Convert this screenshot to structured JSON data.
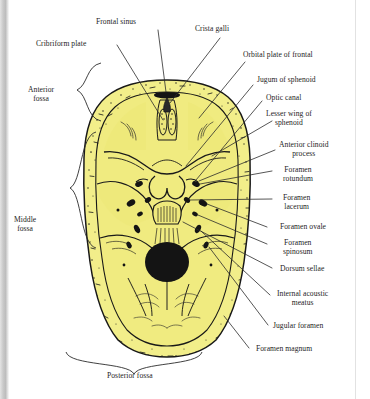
{
  "figure": {
    "view": "superior view of cranial floor",
    "colors": {
      "bone_fill": "#F2EE8A",
      "bone_fill_shadow": "#E6DF72",
      "ink": "#1A1A1A",
      "leader_line": "#2b2b2b",
      "label_text": "#1d1d1d",
      "page_background": "#ffffff",
      "scan_edge_gray": "#c9c9c9",
      "foramen_fill": "#141414"
    }
  },
  "labels": {
    "cribriform_plate": "Cribriform plate",
    "frontal_sinus": "Frontal sinus",
    "crista_galli": "Crista galli",
    "orbital_plate_of_frontal": "Orbital plate of frontal",
    "jugum_of_sphenoid": "Jugum of sphenoid",
    "optic_canal": "Optic canal",
    "lesser_wing_of_sphenoid": "Lesser wing of\nsphenoid",
    "anterior_clinoid_process": "Anterior clinoid\nprocess",
    "foramen_rotundum": "Foramen\nrotundum",
    "foramen_lacerum": "Foramen\nlacerum",
    "foramen_ovale": "Foramen ovale",
    "foramen_spinosum": "Foramen\nspinosum",
    "dorsum_sellae": "Dorsum sellae",
    "internal_acoustic_meatus": "Internal acoustic\nmeatus",
    "jugular_foramen": "Jugular foramen",
    "foramen_magnum": "Foramen magnum",
    "anterior_fossa": "Anterior\nfossa",
    "middle_fossa": "Middle\nfossa",
    "posterior_fossa": "Posterior fossa"
  },
  "fossae": [
    {
      "name": "anterior_fossa",
      "label": "Anterior fossa",
      "side": "left"
    },
    {
      "name": "middle_fossa",
      "label": "Middle fossa",
      "side": "left"
    },
    {
      "name": "posterior_fossa",
      "label": "Posterior fossa",
      "side": "bottom"
    }
  ],
  "structures": [
    {
      "name": "frontal_sinus",
      "label": "Frontal sinus",
      "kind": "air_sinus",
      "side": "midline"
    },
    {
      "name": "crista_galli",
      "label": "Crista galli",
      "kind": "bony_ridge",
      "side": "midline"
    },
    {
      "name": "cribriform_plate",
      "label": "Cribriform plate",
      "kind": "perforated_plate",
      "side": "midline"
    },
    {
      "name": "orbital_plate_of_frontal",
      "label": "Orbital plate of frontal",
      "kind": "bone_plate",
      "side": "right"
    },
    {
      "name": "jugum_of_sphenoid",
      "label": "Jugum of sphenoid",
      "kind": "bone_plate",
      "side": "midline"
    },
    {
      "name": "optic_canal",
      "label": "Optic canal",
      "kind": "canal",
      "side": "right"
    },
    {
      "name": "lesser_wing_of_sphenoid",
      "label": "Lesser wing of sphenoid",
      "kind": "bone_wing",
      "side": "right"
    },
    {
      "name": "anterior_clinoid_process",
      "label": "Anterior clinoid process",
      "kind": "process",
      "side": "right"
    },
    {
      "name": "foramen_rotundum",
      "label": "Foramen rotundum",
      "kind": "foramen",
      "side": "bilateral"
    },
    {
      "name": "foramen_lacerum",
      "label": "Foramen lacerum",
      "kind": "foramen",
      "side": "bilateral"
    },
    {
      "name": "foramen_ovale",
      "label": "Foramen ovale",
      "kind": "foramen",
      "side": "bilateral"
    },
    {
      "name": "foramen_spinosum",
      "label": "Foramen spinosum",
      "kind": "foramen",
      "side": "bilateral"
    },
    {
      "name": "dorsum_sellae",
      "label": "Dorsum sellae",
      "kind": "bony_plate",
      "side": "midline"
    },
    {
      "name": "internal_acoustic_meatus",
      "label": "Internal acoustic meatus",
      "kind": "meatus",
      "side": "bilateral"
    },
    {
      "name": "jugular_foramen",
      "label": "Jugular foramen",
      "kind": "foramen",
      "side": "bilateral"
    },
    {
      "name": "foramen_magnum",
      "label": "Foramen magnum",
      "kind": "foramen",
      "side": "midline"
    }
  ]
}
